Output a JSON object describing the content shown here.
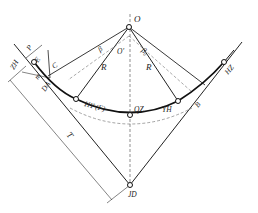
{
  "diagram": {
    "labels": {
      "O": "O",
      "O_prime": "O'",
      "beta_left": "β",
      "beta_right": "β₀",
      "R_left": "R",
      "R_right": "R",
      "C": "C",
      "P": "P",
      "E": "E",
      "m": "m",
      "DA": "DA",
      "ZH": "ZH",
      "HY_F": "HY (F)",
      "QZ": "QZ",
      "YH": "YH",
      "B": "B",
      "HZ": "HZ",
      "T": "T",
      "JD": "JD"
    },
    "points": [
      {
        "name": "O",
        "x": 129,
        "y": 27
      },
      {
        "name": "ZH",
        "x": 34,
        "y": 62
      },
      {
        "name": "HY",
        "x": 76,
        "y": 99
      },
      {
        "name": "QZ",
        "x": 130,
        "y": 115
      },
      {
        "name": "YH",
        "x": 178,
        "y": 101
      },
      {
        "name": "HZ",
        "x": 224,
        "y": 62
      },
      {
        "name": "JD",
        "x": 130,
        "y": 185
      }
    ]
  }
}
